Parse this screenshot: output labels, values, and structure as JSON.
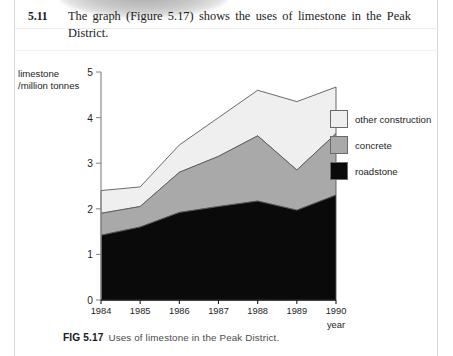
{
  "question": {
    "number": "5.11",
    "line1": "The graph (Figure 5.17) shows the uses of limestone in the Peak",
    "line2": "District."
  },
  "figure": {
    "caption_fig": "FIG 5.17",
    "caption_text": "Uses of limestone in the Peak District."
  },
  "colors": {
    "other_construction": "#efefef",
    "concrete": "#a9a9a9",
    "roadstone": "#0a0a0a",
    "outline": "#5a5a5a",
    "axis": "#8a8a8a",
    "text": "#1d1d1d"
  },
  "chart_data": {
    "type": "area",
    "stacked": true,
    "title": "",
    "subtitle": "",
    "xlabel": "year",
    "ylabel": "limestone /million tonnes",
    "ylabel_line1": "limestone",
    "ylabel_line2": "/million tonnes",
    "x": [
      1984,
      1985,
      1986,
      1987,
      1988,
      1989,
      1990
    ],
    "categories": [
      "1984",
      "1985",
      "1986",
      "1987",
      "1988",
      "1989",
      "1990"
    ],
    "xtick_labels": [
      "1984",
      "1985",
      "1986",
      "1987",
      "1988",
      "1989",
      "1990"
    ],
    "ytick_labels": [
      "0",
      "1",
      "2",
      "3",
      "4",
      "5"
    ],
    "ytick_values": [
      0,
      1,
      2,
      3,
      4,
      5
    ],
    "ylim": [
      0,
      5
    ],
    "xlim": [
      1984,
      1990
    ],
    "grid": false,
    "legend_position": "right",
    "series": [
      {
        "name": "roadstone",
        "values": [
          1.42,
          1.6,
          1.92,
          2.05,
          2.17,
          1.97,
          2.3
        ]
      },
      {
        "name": "concrete",
        "values": [
          0.48,
          0.45,
          0.88,
          1.1,
          1.43,
          0.88,
          1.35
        ]
      },
      {
        "name": "other construction",
        "values": [
          0.5,
          0.43,
          0.6,
          0.85,
          1.0,
          1.5,
          1.02
        ]
      }
    ],
    "cumulative": [
      {
        "name": "roadstone",
        "values": [
          1.42,
          1.6,
          1.92,
          2.05,
          2.17,
          1.97,
          2.3
        ]
      },
      {
        "name": "roadstone+concrete",
        "values": [
          1.9,
          2.05,
          2.8,
          3.15,
          3.6,
          2.85,
          3.65
        ]
      },
      {
        "name": "total",
        "values": [
          2.4,
          2.48,
          3.4,
          4.0,
          4.6,
          4.35,
          4.67
        ]
      }
    ],
    "legend": [
      {
        "label": "other construction",
        "color": "#efefef"
      },
      {
        "label": "concrete",
        "color": "#a9a9a9"
      },
      {
        "label": "roadstone",
        "color": "#0a0a0a"
      }
    ]
  }
}
